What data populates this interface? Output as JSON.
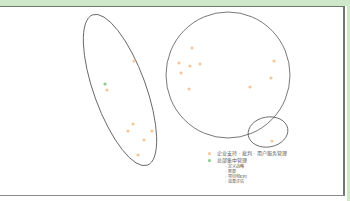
{
  "colors": {
    "band": "#cfe8c9",
    "outline": "#555555",
    "orange_dot": "#f5c79a",
    "green_dot": "#8cc98a"
  },
  "clusters": [
    {
      "name": "left-ellipse",
      "cx": 120,
      "cy": 90,
      "rx": 26,
      "ry": 80,
      "rotate": -20
    },
    {
      "name": "large-circle",
      "cx": 228,
      "cy": 75,
      "rx": 62,
      "ry": 63,
      "rotate": 0
    },
    {
      "name": "small-circle",
      "cx": 268,
      "cy": 132,
      "rx": 20,
      "ry": 15,
      "rotate": -10
    }
  ],
  "points": [
    {
      "x": 134,
      "y": 61,
      "type": "orange"
    },
    {
      "x": 105,
      "y": 84,
      "type": "green"
    },
    {
      "x": 107,
      "y": 90,
      "type": "orange"
    },
    {
      "x": 133,
      "y": 124,
      "type": "orange"
    },
    {
      "x": 128,
      "y": 131,
      "type": "orange"
    },
    {
      "x": 152,
      "y": 131,
      "type": "orange"
    },
    {
      "x": 144,
      "y": 140,
      "type": "orange"
    },
    {
      "x": 138,
      "y": 155,
      "type": "orange"
    },
    {
      "x": 192,
      "y": 48,
      "type": "orange"
    },
    {
      "x": 179,
      "y": 63,
      "type": "orange"
    },
    {
      "x": 190,
      "y": 66,
      "type": "orange"
    },
    {
      "x": 200,
      "y": 64,
      "type": "orange"
    },
    {
      "x": 181,
      "y": 73,
      "type": "orange"
    },
    {
      "x": 189,
      "y": 89,
      "type": "orange"
    },
    {
      "x": 250,
      "y": 87,
      "type": "orange"
    },
    {
      "x": 274,
      "y": 61,
      "type": "orange"
    },
    {
      "x": 271,
      "y": 78,
      "type": "orange"
    },
    {
      "x": 272,
      "y": 141,
      "type": "orange"
    }
  ],
  "legend": {
    "item1": "企业支持 · 批判 · 用户服务管理",
    "item2": "总部集中管理",
    "subitems": [
      "- 定义战略",
      "- 框架",
      "- 项目和KPI",
      "- 效果评估"
    ]
  }
}
